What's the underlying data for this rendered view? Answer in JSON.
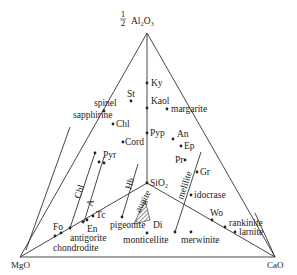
{
  "diagram": {
    "type": "ternary",
    "title": "",
    "vertices": {
      "top": {
        "label": "Al2O3",
        "prefix": "1/2",
        "display": "½ Al₂O₃"
      },
      "left": {
        "label": "MgO"
      },
      "right": {
        "label": "CaO"
      }
    },
    "labels": {
      "half": "1",
      "half_den": "2",
      "al2o3": "Al₂O₃",
      "mgo": "MgO",
      "cao": "CaO",
      "sio2": "SiO₂",
      "ky": "Ky",
      "kaol": "Kaol",
      "margarite": "margarite",
      "st": "St",
      "spinel": "spinel",
      "sapphirine": "sapphirine",
      "chl": "Chl",
      "cord": "Cord",
      "pyp": "Pyp",
      "an": "An",
      "ep": "Ep",
      "pr": "Pr",
      "gr": "Gr",
      "melilite": "melilite",
      "idocrase": "idocrase",
      "pyr": "Pyr",
      "hb": "Hb",
      "chl_line": "Chl",
      "a_line": "A",
      "tc": "Tc",
      "en": "En",
      "fo": "Fo",
      "antigorite": "antigorite",
      "chondrodite": "chondrodite",
      "augite": "augite",
      "di": "Di",
      "pigeonite": "pigeonite",
      "monticellite": "monticellite",
      "merwinite": "merwinite",
      "wo": "Wo",
      "rankinite": "rankinite",
      "larnite": "larnite"
    },
    "phases": [
      "Ky",
      "Kaol",
      "margarite",
      "St",
      "spinel",
      "sapphirine",
      "Chl",
      "Cord",
      "Pyp",
      "An",
      "Ep",
      "Pr",
      "Gr",
      "idocrase",
      "Pyr",
      "Tc",
      "En",
      "Fo",
      "antigorite",
      "chondrodite",
      "Di",
      "pigeonite",
      "monticellite",
      "merwinite",
      "Wo",
      "rankinite",
      "larnite",
      "SiO2"
    ],
    "solid_solution_lines": [
      "Chl",
      "A",
      "Hb",
      "augite",
      "melilite"
    ]
  }
}
